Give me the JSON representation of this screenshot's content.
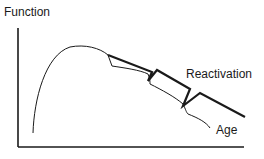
{
  "diagram": {
    "y_axis_label": "Function",
    "x_axis_label": "",
    "series": [
      {
        "name": "Reactivation",
        "label": "Reactivation",
        "style": "thick"
      },
      {
        "name": "Age",
        "label": "Age",
        "style": "thin"
      }
    ],
    "colors": {
      "line": "#1a1a1a",
      "background": "#ffffff"
    }
  }
}
